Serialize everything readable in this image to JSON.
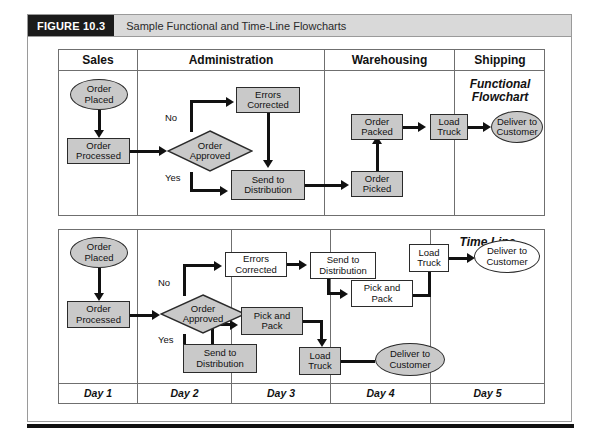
{
  "figure": {
    "badge": "FIGURE 10.3",
    "caption": "Sample Functional and Time-Line Flowcharts"
  },
  "colors": {
    "shape_fill": "#c9c9c9",
    "shape_fill_alt": "#ffffff",
    "shape_stroke": "#2b2b2b",
    "panel_stroke": "#6f6f6f",
    "header_band": "#d9d9d9",
    "badge_bg": "#1b1b1b",
    "connector": "#111111"
  },
  "functional_chart": {
    "title": "Functional\nFlowchart",
    "lanes": [
      {
        "label": "Sales"
      },
      {
        "label": "Administration"
      },
      {
        "label": "Warehousing"
      },
      {
        "label": "Shipping"
      }
    ],
    "branch_labels": {
      "no": "No",
      "yes": "Yes"
    },
    "nodes": [
      {
        "id": "order-placed",
        "label": "Order\nPlaced",
        "shape": "ellipse",
        "fill": "gray",
        "lane": "Sales"
      },
      {
        "id": "order-processed",
        "label": "Order\nProcessed",
        "shape": "box",
        "fill": "gray",
        "lane": "Sales"
      },
      {
        "id": "order-approved",
        "label": "Order\nApproved",
        "shape": "diamond",
        "fill": "gray",
        "lane": "Administration"
      },
      {
        "id": "errors-corrected",
        "label": "Errors\nCorrected",
        "shape": "box",
        "fill": "gray",
        "lane": "Administration"
      },
      {
        "id": "send-to-distribution",
        "label": "Send to\nDistribution",
        "shape": "box",
        "fill": "gray",
        "lane": "Administration"
      },
      {
        "id": "order-picked",
        "label": "Order\nPicked",
        "shape": "box",
        "fill": "gray",
        "lane": "Warehousing"
      },
      {
        "id": "order-packed",
        "label": "Order\nPacked",
        "shape": "box",
        "fill": "gray",
        "lane": "Warehousing"
      },
      {
        "id": "load-truck",
        "label": "Load\nTruck",
        "shape": "box",
        "fill": "gray",
        "lane": "Warehousing"
      },
      {
        "id": "deliver-to-customer",
        "label": "Deliver to\nCustomer",
        "shape": "ellipse",
        "fill": "gray",
        "lane": "Shipping"
      }
    ]
  },
  "timeline_chart": {
    "title": "Time Line",
    "lanes": [
      {
        "label": "Day 1"
      },
      {
        "label": "Day 2"
      },
      {
        "label": "Day 3"
      },
      {
        "label": "Day 4"
      },
      {
        "label": "Day 5"
      }
    ],
    "branch_labels": {
      "no": "No",
      "yes": "Yes"
    },
    "nodes": [
      {
        "id": "tl-order-placed",
        "label": "Order\nPlaced",
        "shape": "ellipse",
        "fill": "gray",
        "lane": "Day 1"
      },
      {
        "id": "tl-order-processed",
        "label": "Order\nProcessed",
        "shape": "box",
        "fill": "gray",
        "lane": "Day 1"
      },
      {
        "id": "tl-order-approved",
        "label": "Order\nApproved",
        "shape": "diamond",
        "fill": "gray",
        "lane": "Day 2"
      },
      {
        "id": "tl-errors-corrected",
        "label": "Errors\nCorrected",
        "shape": "box",
        "fill": "white",
        "lane": "Day 2"
      },
      {
        "id": "tl-send-dist-yes",
        "label": "Send to\nDistribution",
        "shape": "box",
        "fill": "gray",
        "lane": "Day 2"
      },
      {
        "id": "tl-send-dist-no",
        "label": "Send to\nDistribution",
        "shape": "box",
        "fill": "white",
        "lane": "Day 3"
      },
      {
        "id": "tl-pick-pack-yes",
        "label": "Pick and\nPack",
        "shape": "box",
        "fill": "gray",
        "lane": "Day 3"
      },
      {
        "id": "tl-pick-pack-no",
        "label": "Pick and\nPack",
        "shape": "box",
        "fill": "white",
        "lane": "Day 3"
      },
      {
        "id": "tl-load-truck-yes",
        "label": "Load\nTruck",
        "shape": "box",
        "fill": "gray",
        "lane": "Day 3"
      },
      {
        "id": "tl-load-truck-no",
        "label": "Load\nTruck",
        "shape": "box",
        "fill": "white",
        "lane": "Day 4"
      },
      {
        "id": "tl-deliver-yes",
        "label": "Deliver to\nCustomer",
        "shape": "ellipse",
        "fill": "gray",
        "lane": "Day 4"
      },
      {
        "id": "tl-deliver-no",
        "label": "Deliver to\nCustomer",
        "shape": "ellipse",
        "fill": "white",
        "lane": "Day 5"
      }
    ]
  }
}
